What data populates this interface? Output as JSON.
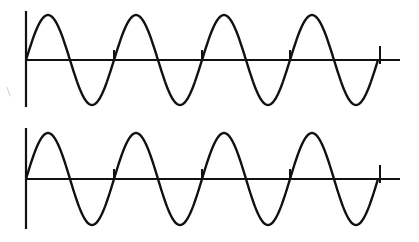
{
  "figure": {
    "line_color": "#111111",
    "background": "#ffffff",
    "panels": [
      {
        "id": "top",
        "axis_x": 26,
        "axis_top": 11,
        "axis_bottom": 107,
        "baseline_y": 60,
        "baseline_end_x": 400,
        "amplitude": 45,
        "period_px": 88,
        "cycles": 4,
        "start_x": 26,
        "end_tick_x": 380,
        "end_tick_top": 46
      },
      {
        "id": "bottom",
        "axis_x": 26,
        "axis_top": 7,
        "axis_bottom": 108,
        "baseline_y": 58,
        "baseline_end_x": 400,
        "amplitude": 46,
        "period_px": 88,
        "cycles": 4,
        "start_x": 26,
        "end_tick_x": 380,
        "end_tick_top": 44
      }
    ]
  }
}
